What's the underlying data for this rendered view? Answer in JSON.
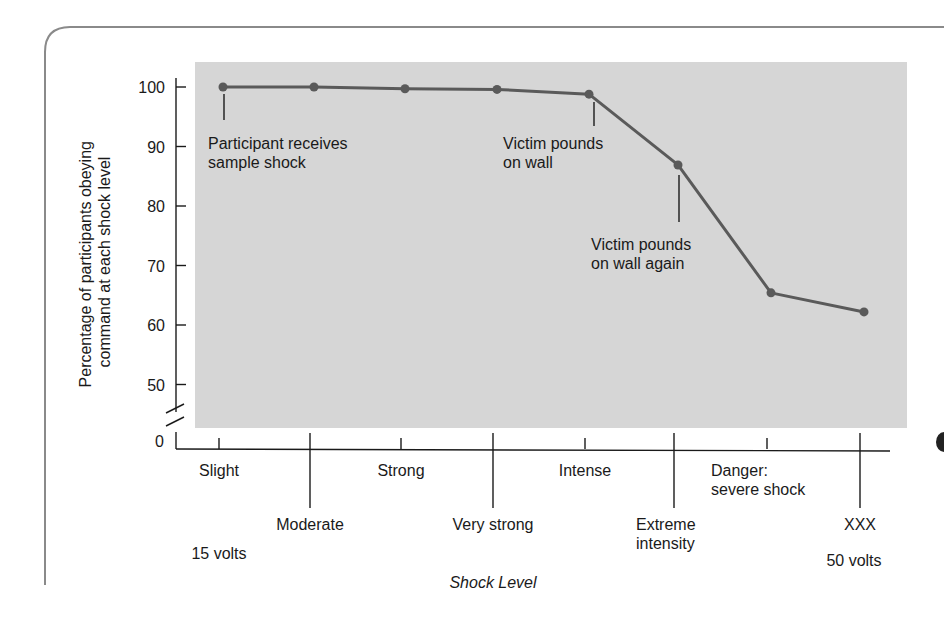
{
  "chart_data": {
    "type": "line",
    "title": "",
    "xlabel": "Shock Level",
    "ylabel_lines": [
      "Percentage of participants obeying",
      "command at each shock level"
    ],
    "ylabel": "Percentage of participants obeying command at each shock level",
    "y_ticks": [
      0,
      50,
      60,
      70,
      80,
      90,
      100
    ],
    "y_axis_break": true,
    "ylim": [
      45,
      100
    ],
    "grid": false,
    "legend": null,
    "categories": [
      "Slight",
      "Moderate",
      "Strong",
      "Very strong",
      "Intense",
      "Extreme intensity",
      "Danger: severe shock",
      "XXX"
    ],
    "x_tick_labels": [
      {
        "label_lines": [
          "Slight"
        ],
        "row": "upper",
        "tick": "short"
      },
      {
        "label_lines": [
          "Moderate"
        ],
        "row": "lower",
        "tick": "long"
      },
      {
        "label_lines": [
          "Strong"
        ],
        "row": "upper",
        "tick": "short"
      },
      {
        "label_lines": [
          "Very strong"
        ],
        "row": "lower",
        "tick": "long"
      },
      {
        "label_lines": [
          "Intense"
        ],
        "row": "upper",
        "tick": "short"
      },
      {
        "label_lines": [
          "Extreme",
          "intensity"
        ],
        "row": "lower",
        "tick": "long"
      },
      {
        "label_lines": [
          "Danger:",
          "severe shock"
        ],
        "row": "upper",
        "tick": "short"
      },
      {
        "label_lines": [
          "XXX"
        ],
        "row": "lower",
        "tick": "long"
      }
    ],
    "voltage_labels": {
      "start": "15 volts",
      "end": "50 volts"
    },
    "series": [
      {
        "name": "Obedience",
        "values": [
          100,
          100,
          99.7,
          99.6,
          98.8,
          86.9,
          65.4,
          62.2
        ]
      }
    ],
    "annotations": [
      {
        "point_index": 0,
        "text_lines": [
          "Participant receives",
          "sample shock"
        ]
      },
      {
        "point_index": 4,
        "text_lines": [
          "Victim pounds",
          "on wall"
        ]
      },
      {
        "point_index": 5,
        "text_lines": [
          "Victim pounds",
          "on wall again"
        ]
      }
    ]
  },
  "colors": {
    "panel": "#d6d6d6",
    "line": "#5a5a5a",
    "marker": "#5a5a5a",
    "axis": "#1a1a1a",
    "frame": "#8a8a8a",
    "text": "#1a1a1a"
  }
}
